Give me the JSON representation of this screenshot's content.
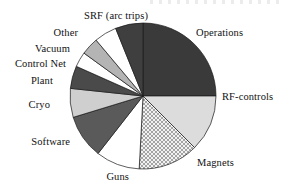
{
  "chart_data": {
    "type": "pie",
    "title": "",
    "subtitle": "",
    "xlabel": "",
    "ylabel": "",
    "legend_position": "outside-labels",
    "grid": false,
    "start_angle_deg": 0,
    "direction": "clockwise",
    "categories": [
      "Operations",
      "RF-controls",
      "Magnets",
      "Guns",
      "Software",
      "Cryo",
      "Plant",
      "Control Net",
      "Vacuum",
      "Other",
      "SRF (arc trips)"
    ],
    "values": [
      25.0,
      12.5,
      13.3,
      9.7,
      9.7,
      6.4,
      5.0,
      3.3,
      3.9,
      5.0,
      6.2
    ],
    "units": "percent",
    "slices": [
      {
        "label": "Operations",
        "value": 25.0,
        "start_deg": 0,
        "end_deg": 90,
        "fill": "#3a3a3a",
        "pattern": "solid",
        "label_side": "right",
        "label_x": 196,
        "label_y": 33
      },
      {
        "label": "RF-controls",
        "value": 12.5,
        "start_deg": 90,
        "end_deg": 135,
        "fill": "#dcdcdc",
        "pattern": "solid",
        "label_side": "right",
        "label_x": 222,
        "label_y": 97
      },
      {
        "label": "Magnets",
        "value": 13.3,
        "start_deg": 135,
        "end_deg": 183,
        "fill": "#e8e8e8",
        "pattern": "crosshatch",
        "label_side": "right",
        "label_x": 197,
        "label_y": 163
      },
      {
        "label": "Guns",
        "value": 9.7,
        "start_deg": 183,
        "end_deg": 218,
        "fill": "#ffffff",
        "pattern": "solid",
        "label_side": "left",
        "label_x": 129,
        "label_y": 177
      },
      {
        "label": "Software",
        "value": 9.7,
        "start_deg": 218,
        "end_deg": 253,
        "fill": "#5a5a5a",
        "pattern": "solid",
        "label_side": "left",
        "label_x": 70,
        "label_y": 142
      },
      {
        "label": "Cryo",
        "value": 6.4,
        "start_deg": 253,
        "end_deg": 276,
        "fill": "#cfcfcf",
        "pattern": "solid",
        "label_side": "left",
        "label_x": 50,
        "label_y": 105
      },
      {
        "label": "Plant",
        "value": 5.0,
        "start_deg": 276,
        "end_deg": 294,
        "fill": "#4a4a4a",
        "pattern": "solid",
        "label_side": "left",
        "label_x": 53,
        "label_y": 81
      },
      {
        "label": "Control Net",
        "value": 3.3,
        "start_deg": 294,
        "end_deg": 306,
        "fill": "#ffffff",
        "pattern": "solid",
        "label_side": "left",
        "label_x": 66,
        "label_y": 64
      },
      {
        "label": "Vacuum",
        "value": 3.9,
        "start_deg": 306,
        "end_deg": 320,
        "fill": "#b4b4b4",
        "pattern": "solid",
        "label_side": "left",
        "label_x": 70,
        "label_y": 49
      },
      {
        "label": "Other",
        "value": 5.0,
        "start_deg": 320,
        "end_deg": 338,
        "fill": "#ffffff",
        "pattern": "solid",
        "label_side": "left",
        "label_x": 78,
        "label_y": 33
      },
      {
        "label": "SRF (arc trips)",
        "value": 6.2,
        "start_deg": 338,
        "end_deg": 360,
        "fill": "#3f3f3f",
        "pattern": "solid",
        "label_side": "left",
        "label_x": 148,
        "label_y": 16
      }
    ],
    "geometry": {
      "center_x": 143,
      "center_y": 96,
      "radius": 73
    },
    "colors": {
      "outline": "#1a1a1a",
      "background": "#ffffff",
      "text": "#111111"
    }
  }
}
